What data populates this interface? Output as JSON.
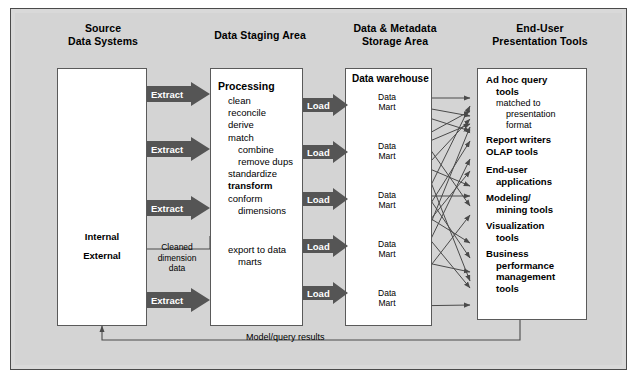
{
  "figure": {
    "background_color": "#d4d4d4",
    "frame_color": "#4a4a4a",
    "arrow_fill": "#555555",
    "arrow_text_color": "#ffffff",
    "box_fill": "#ffffff"
  },
  "columns": [
    {
      "id": "source",
      "header_line1": "Source",
      "header_line2": "Data Systems"
    },
    {
      "id": "staging",
      "header_line1": "Data Staging Area",
      "header_line2": ""
    },
    {
      "id": "storage",
      "header_line1": "Data & Metadata",
      "header_line2": "Storage Area"
    },
    {
      "id": "enduser",
      "header_line1": "End-User",
      "header_line2": "Presentation Tools"
    }
  ],
  "source_systems": {
    "icons": [
      "mainframe-icon",
      "workstation-icon",
      "database-cylinder-icon",
      "external-reports-icon"
    ],
    "internal_label": "Internal",
    "external_label": "External"
  },
  "extract_arrows": [
    {
      "label": "Extract"
    },
    {
      "label": "Extract"
    },
    {
      "label": "Extract"
    },
    {
      "label": "Extract"
    }
  ],
  "load_arrows": [
    {
      "label": "Load"
    },
    {
      "label": "Load"
    },
    {
      "label": "Load"
    },
    {
      "label": "Load"
    },
    {
      "label": "Load"
    }
  ],
  "staging": {
    "title": "Processing",
    "steps": [
      {
        "text": "clean",
        "indent": 1,
        "bold": false
      },
      {
        "text": "reconcile",
        "indent": 1,
        "bold": false
      },
      {
        "text": "derive",
        "indent": 1,
        "bold": false
      },
      {
        "text": "match",
        "indent": 1,
        "bold": false
      },
      {
        "text": "combine",
        "indent": 2,
        "bold": false
      },
      {
        "text": "remove dups",
        "indent": 2,
        "bold": false
      },
      {
        "text": "standardize",
        "indent": 1,
        "bold": false
      },
      {
        "text": "transform",
        "indent": 1,
        "bold": true
      },
      {
        "text": "conform",
        "indent": 1,
        "bold": false
      },
      {
        "text": "dimensions",
        "indent": 2,
        "bold": false
      }
    ],
    "export_line1": "export to data",
    "export_line2": "marts"
  },
  "cleaned_feedback": {
    "line1": "Cleaned",
    "line2": "dimension",
    "line3": "data"
  },
  "storage": {
    "title": "Data warehouse",
    "data_marts": [
      {
        "line1": "Data",
        "line2": "Mart"
      },
      {
        "line1": "Data",
        "line2": "Mart"
      },
      {
        "line1": "Data",
        "line2": "Mart"
      },
      {
        "line1": "Data",
        "line2": "Mart"
      },
      {
        "line1": "Data",
        "line2": "Mart"
      }
    ]
  },
  "end_user_tools": [
    {
      "lines": [
        "Ad hoc query",
        "tools"
      ],
      "bold": true,
      "gray": false,
      "indents": [
        0,
        1
      ]
    },
    {
      "lines": [
        "matched to",
        "presentation",
        "format"
      ],
      "bold": false,
      "gray": true,
      "indents": [
        1,
        2,
        2
      ]
    },
    {
      "lines": [
        "Report writers"
      ],
      "bold": true,
      "gray": false,
      "indents": [
        0
      ]
    },
    {
      "lines": [
        "OLAP tools"
      ],
      "bold": true,
      "gray": false,
      "indents": [
        0
      ]
    },
    {
      "lines": [
        "End-user",
        "applications"
      ],
      "bold": true,
      "gray": false,
      "indents": [
        0,
        1
      ]
    },
    {
      "lines": [
        "Modeling/",
        "mining tools"
      ],
      "bold": true,
      "gray": false,
      "indents": [
        0,
        1
      ]
    },
    {
      "lines": [
        "Visualization",
        "tools"
      ],
      "bold": true,
      "gray": false,
      "indents": [
        0,
        1
      ]
    },
    {
      "lines": [
        "Business",
        "performance",
        "management",
        "tools"
      ],
      "bold": true,
      "gray": false,
      "indents": [
        0,
        1,
        1,
        1
      ]
    }
  ],
  "feedback_loop": {
    "label": "Model/query results"
  }
}
